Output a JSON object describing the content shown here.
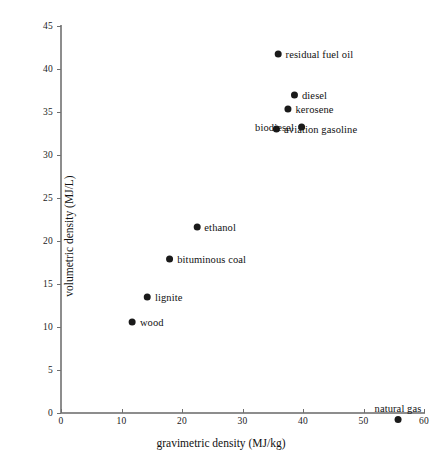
{
  "chart_data": {
    "type": "scatter",
    "title": "",
    "xlabel": "gravimetric density (MJ/kg)",
    "ylabel": "volumetric density (MJ/L)",
    "xlim": [
      0,
      60
    ],
    "ylim": [
      0,
      46
    ],
    "xticks": [
      0,
      10,
      20,
      30,
      40,
      50,
      60
    ],
    "yticks": [
      0,
      5,
      10,
      15,
      20,
      25,
      30,
      35,
      40,
      45
    ],
    "grid": false,
    "legend": "none",
    "point_color": "#1a1a1a",
    "axis_color": "#8d8d8d",
    "points": [
      {
        "label": "residual fuel oil",
        "x": 41.8,
        "y": 41.8,
        "label_pos": "right"
      },
      {
        "label": "diesel",
        "x": 41.0,
        "y": 37.0,
        "label_pos": "right"
      },
      {
        "label": "kerosene",
        "x": 41.0,
        "y": 35.3,
        "label_pos": "right"
      },
      {
        "label": "aviation gasoline",
        "x": 42.0,
        "y": 33.0,
        "label_pos": "right"
      },
      {
        "label": "biodiesel",
        "x": 36.2,
        "y": 33.2,
        "label_pos": "left"
      },
      {
        "label": "ethanol",
        "x": 25.4,
        "y": 21.6,
        "label_pos": "right"
      },
      {
        "label": "bituminous coal",
        "x": 24.0,
        "y": 17.9,
        "label_pos": "right"
      },
      {
        "label": "lignite",
        "x": 16.9,
        "y": 13.5,
        "label_pos": "right"
      },
      {
        "label": "wood",
        "x": 14.1,
        "y": 10.6,
        "label_pos": "right"
      },
      {
        "label": "natural gas",
        "x": 55.7,
        "y": 0.0,
        "label_pos": "above"
      }
    ]
  }
}
